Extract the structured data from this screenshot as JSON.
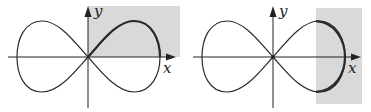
{
  "figure": {
    "colors": {
      "curve": "#2a2a2a",
      "shade": "#d9d9d9",
      "axis": "#222222"
    },
    "panels": [
      {
        "id": "left",
        "x_label": "x",
        "y_label": "y",
        "shaded_region": "first quadrant (x >= 0, y >= 0)",
        "highlighted_arc": "upper-right lobe portion"
      },
      {
        "id": "right",
        "x_label": "x",
        "y_label": "y",
        "shaded_region": "vertical strip on right side (x >= ~0.6a)",
        "highlighted_arc": "right tip of right lobe"
      }
    ]
  }
}
